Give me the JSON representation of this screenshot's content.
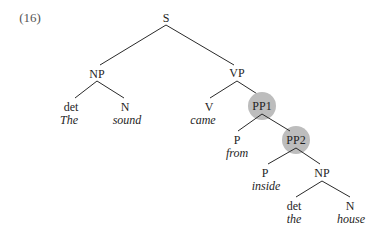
{
  "example_number": "(16)",
  "colors": {
    "line": "#2a2a2a",
    "highlight": "#bdbdbd",
    "text": "#1e1e1e"
  },
  "tree": {
    "S": "S",
    "NP_subj": "NP",
    "det_subj": "det",
    "det_subj_word": "The",
    "N_subj": "N",
    "N_subj_word": "sound",
    "VP": "VP",
    "V": "V",
    "V_word": "came",
    "PP1": "PP1",
    "P1": "P",
    "P1_word": "from",
    "PP2": "PP2",
    "P2": "P",
    "P2_word": "inside",
    "NP_obj": "NP",
    "det_obj": "det",
    "det_obj_word": "the",
    "N_obj": "N",
    "N_obj_word": "house"
  }
}
